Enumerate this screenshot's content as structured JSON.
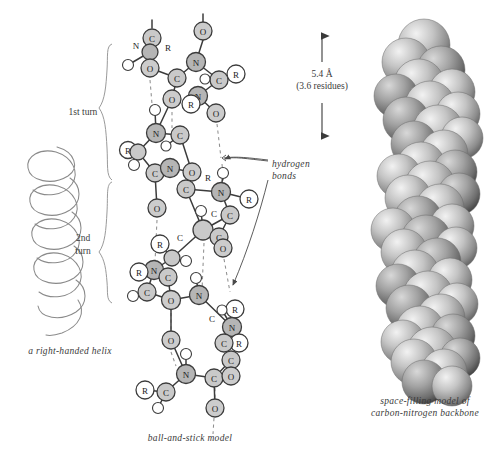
{
  "figure": {
    "title_present": false,
    "background": "#ffffff",
    "ink": "#3a3a3a"
  },
  "helix_panel": {
    "caption": "a right-handed helix",
    "turns": [
      {
        "label_line1": "1st turn",
        "label_line2": ""
      },
      {
        "label_line1": "2nd",
        "label_line2": "turn"
      }
    ]
  },
  "ball_and_stick": {
    "caption": "ball-and-stick model",
    "annotation": {
      "line1": "hydrogen",
      "line2": "bonds"
    },
    "atom_colors": {
      "carbon": "#c9c9c9",
      "nitrogen": "#b5b5b5",
      "oxygen": "#cccccc",
      "residue": "#ffffff",
      "hydrogen": "#ffffff",
      "outline": "#3c3c3c"
    },
    "atoms": [
      {
        "x": 152,
        "y": 38,
        "r": 9,
        "label": "C",
        "kind": "carbon"
      },
      {
        "x": 136,
        "y": 45,
        "r": 0,
        "label": "N",
        "kind": "free"
      },
      {
        "x": 168,
        "y": 47,
        "r": 0,
        "label": "R",
        "kind": "free"
      },
      {
        "x": 150,
        "y": 52,
        "r": 8,
        "label": "",
        "kind": "nitrogen"
      },
      {
        "x": 128,
        "y": 65,
        "r": 5.5,
        "label": "",
        "kind": "hydrogen"
      },
      {
        "x": 150,
        "y": 68,
        "r": 9,
        "label": "O",
        "kind": "oxygen"
      },
      {
        "x": 177,
        "y": 78,
        "r": 9,
        "label": "C",
        "kind": "carbon"
      },
      {
        "x": 203,
        "y": 31,
        "r": 9,
        "label": "O",
        "kind": "oxygen"
      },
      {
        "x": 196,
        "y": 62,
        "r": 9.5,
        "label": "N",
        "kind": "nitrogen"
      },
      {
        "x": 236,
        "y": 74,
        "r": 9,
        "label": "R",
        "kind": "residue"
      },
      {
        "x": 219,
        "y": 80,
        "r": 9,
        "label": "C",
        "kind": "carbon"
      },
      {
        "x": 205,
        "y": 79,
        "r": 5,
        "label": "",
        "kind": "hydrogen"
      },
      {
        "x": 172,
        "y": 99,
        "r": 9,
        "label": "O",
        "kind": "oxygen"
      },
      {
        "x": 198,
        "y": 96,
        "r": 9.5,
        "label": "N",
        "kind": "nitrogen"
      },
      {
        "x": 191,
        "y": 104,
        "r": 9,
        "label": "R",
        "kind": "residue"
      },
      {
        "x": 216,
        "y": 113,
        "r": 9,
        "label": "O",
        "kind": "oxygen"
      },
      {
        "x": 155,
        "y": 110,
        "r": 5.5,
        "label": "",
        "kind": "hydrogen"
      },
      {
        "x": 156,
        "y": 133,
        "r": 9.5,
        "label": "N",
        "kind": "nitrogen"
      },
      {
        "x": 180,
        "y": 135,
        "r": 9,
        "label": "C",
        "kind": "carbon"
      },
      {
        "x": 166,
        "y": 146,
        "r": 5,
        "label": "",
        "kind": "hydrogen"
      },
      {
        "x": 128,
        "y": 150,
        "r": 8.5,
        "label": "R",
        "kind": "residue"
      },
      {
        "x": 138,
        "y": 152,
        "r": 8,
        "label": "",
        "kind": "carbon"
      },
      {
        "x": 134,
        "y": 165,
        "r": 5.5,
        "label": "",
        "kind": "hydrogen"
      },
      {
        "x": 155,
        "y": 173,
        "r": 9,
        "label": "C",
        "kind": "carbon"
      },
      {
        "x": 170,
        "y": 168,
        "r": 9.5,
        "label": "N",
        "kind": "nitrogen"
      },
      {
        "x": 192,
        "y": 172,
        "r": 9,
        "label": "O",
        "kind": "oxygen"
      },
      {
        "x": 208,
        "y": 177,
        "r": 0,
        "label": "R",
        "kind": "free"
      },
      {
        "x": 223,
        "y": 173,
        "r": 5.5,
        "label": "",
        "kind": "hydrogen"
      },
      {
        "x": 186,
        "y": 189,
        "r": 9,
        "label": "C",
        "kind": "carbon"
      },
      {
        "x": 221,
        "y": 192,
        "r": 9.5,
        "label": "N",
        "kind": "nitrogen"
      },
      {
        "x": 249,
        "y": 199,
        "r": 9,
        "label": "R",
        "kind": "residue"
      },
      {
        "x": 157,
        "y": 208,
        "r": 9,
        "label": "O",
        "kind": "oxygen"
      },
      {
        "x": 201,
        "y": 211,
        "r": 5.5,
        "label": "",
        "kind": "hydrogen"
      },
      {
        "x": 214,
        "y": 213,
        "r": 0,
        "label": "C",
        "kind": "free"
      },
      {
        "x": 230,
        "y": 215,
        "r": 9,
        "label": "C",
        "kind": "carbon"
      },
      {
        "x": 203,
        "y": 230,
        "r": 10,
        "label": "",
        "kind": "carbon"
      },
      {
        "x": 180,
        "y": 237,
        "r": 0,
        "label": "C",
        "kind": "free"
      },
      {
        "x": 219,
        "y": 237,
        "r": 9,
        "label": "C",
        "kind": "carbon"
      },
      {
        "x": 160,
        "y": 244,
        "r": 9,
        "label": "R",
        "kind": "residue"
      },
      {
        "x": 172,
        "y": 258,
        "r": 8,
        "label": "",
        "kind": "carbon"
      },
      {
        "x": 186,
        "y": 261,
        "r": 5.5,
        "label": "",
        "kind": "hydrogen"
      },
      {
        "x": 223,
        "y": 248,
        "r": 9,
        "label": "O",
        "kind": "oxygen"
      },
      {
        "x": 154,
        "y": 270,
        "r": 9.5,
        "label": "N",
        "kind": "nitrogen"
      },
      {
        "x": 139,
        "y": 272,
        "r": 9,
        "label": "R",
        "kind": "residue"
      },
      {
        "x": 168,
        "y": 277,
        "r": 9,
        "label": "C",
        "kind": "carbon"
      },
      {
        "x": 147,
        "y": 292,
        "r": 9,
        "label": "C",
        "kind": "carbon"
      },
      {
        "x": 133,
        "y": 296,
        "r": 5.5,
        "label": "",
        "kind": "hydrogen"
      },
      {
        "x": 196,
        "y": 278,
        "r": 5.5,
        "label": "",
        "kind": "hydrogen"
      },
      {
        "x": 199,
        "y": 295,
        "r": 9.5,
        "label": "N",
        "kind": "nitrogen"
      },
      {
        "x": 171,
        "y": 300,
        "r": 9.5,
        "label": "O",
        "kind": "oxygen"
      },
      {
        "x": 235,
        "y": 309,
        "r": 9,
        "label": "R",
        "kind": "residue"
      },
      {
        "x": 222,
        "y": 310,
        "r": 5,
        "label": "",
        "kind": "hydrogen"
      },
      {
        "x": 212,
        "y": 318,
        "r": 0,
        "label": "C",
        "kind": "free"
      },
      {
        "x": 232,
        "y": 327,
        "r": 9.5,
        "label": "N",
        "kind": "nitrogen"
      },
      {
        "x": 171,
        "y": 340,
        "r": 9,
        "label": "O",
        "kind": "oxygen"
      },
      {
        "x": 239,
        "y": 343,
        "r": 9,
        "label": "R",
        "kind": "residue"
      },
      {
        "x": 224,
        "y": 343,
        "r": 9,
        "label": "C",
        "kind": "carbon"
      },
      {
        "x": 231,
        "y": 360,
        "r": 9,
        "label": "C",
        "kind": "carbon"
      },
      {
        "x": 186,
        "y": 354,
        "r": 5.5,
        "label": "",
        "kind": "hydrogen"
      },
      {
        "x": 186,
        "y": 374,
        "r": 9.5,
        "label": "N",
        "kind": "nitrogen"
      },
      {
        "x": 214,
        "y": 378,
        "r": 9,
        "label": "C",
        "kind": "carbon"
      },
      {
        "x": 231,
        "y": 376,
        "r": 9,
        "label": "O",
        "kind": "oxygen"
      },
      {
        "x": 145,
        "y": 390,
        "r": 9,
        "label": "R",
        "kind": "residue"
      },
      {
        "x": 166,
        "y": 392,
        "r": 9,
        "label": "C",
        "kind": "carbon"
      },
      {
        "x": 158,
        "y": 408,
        "r": 5.5,
        "label": "",
        "kind": "hydrogen"
      },
      {
        "x": 215,
        "y": 408,
        "r": 9,
        "label": "O",
        "kind": "oxygen"
      }
    ]
  },
  "measure": {
    "value": "5.4 Å",
    "detail": "(3.6 residues)"
  },
  "space_filling": {
    "caption_line1": "space-filling model of",
    "caption_line2": "carbon-nitrogen backbone",
    "sphere_color_light": "#e6e6e6",
    "sphere_color_dark": "#6f6f6f"
  }
}
